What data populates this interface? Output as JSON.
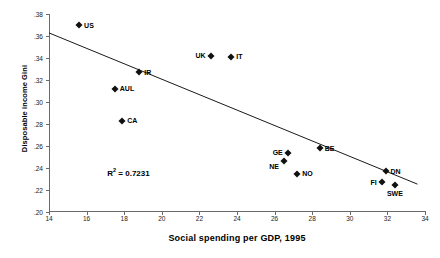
{
  "chart_data": {
    "type": "scatter",
    "title": "",
    "xlabel": "Social spending per GDP, 1995",
    "ylabel": "Disposable income Gini",
    "xlim": [
      14,
      34
    ],
    "ylim": [
      0.2,
      0.38
    ],
    "xticks": [
      "14",
      "16",
      "18",
      "20",
      "22",
      "24",
      "26",
      "28",
      "30",
      "32",
      "34"
    ],
    "xtick_values": [
      14,
      16,
      18,
      20,
      22,
      24,
      26,
      28,
      30,
      32,
      34
    ],
    "yticks": [
      ".20",
      ".22",
      ".24",
      ".26",
      ".28",
      ".30",
      ".32",
      ".34",
      ".36",
      ".38"
    ],
    "ytick_values": [
      0.2,
      0.22,
      0.24,
      0.26,
      0.28,
      0.3,
      0.32,
      0.34,
      0.36,
      0.38
    ],
    "grid": false,
    "legend": "none",
    "marker_shape": "diamond",
    "marker_color": "#111111",
    "points": [
      {
        "label": "US",
        "x": 15.6,
        "y": 0.37,
        "label_pos": "right"
      },
      {
        "label": "AUL",
        "x": 17.5,
        "y": 0.312,
        "label_pos": "right"
      },
      {
        "label": "CA",
        "x": 17.9,
        "y": 0.283,
        "label_pos": "right"
      },
      {
        "label": "IR",
        "x": 18.8,
        "y": 0.327,
        "label_pos": "right"
      },
      {
        "label": "UK",
        "x": 22.6,
        "y": 0.342,
        "label_pos": "left"
      },
      {
        "label": "IT",
        "x": 23.7,
        "y": 0.341,
        "label_pos": "right"
      },
      {
        "label": "GE",
        "x": 26.7,
        "y": 0.254,
        "label_pos": "left"
      },
      {
        "label": "NE",
        "x": 26.5,
        "y": 0.246,
        "label_pos": "below-left"
      },
      {
        "label": "NO",
        "x": 27.2,
        "y": 0.235,
        "label_pos": "right"
      },
      {
        "label": "BE",
        "x": 28.4,
        "y": 0.258,
        "label_pos": "right"
      },
      {
        "label": "FI",
        "x": 31.7,
        "y": 0.227,
        "label_pos": "left"
      },
      {
        "label": "DN",
        "x": 31.9,
        "y": 0.237,
        "label_pos": "right"
      },
      {
        "label": "SWE",
        "x": 32.4,
        "y": 0.225,
        "label_pos": "below"
      }
    ],
    "trendline": {
      "x0": 14.0,
      "y0": 0.3628,
      "x1": 33.6,
      "y1": 0.2253
    },
    "annotations": [
      {
        "text": "R² = 0.7231",
        "x": 17.1,
        "y": 0.2405
      }
    ],
    "r_squared_label": "R",
    "r_squared_sup": "2",
    "r_squared_value": " = 0.7231"
  }
}
